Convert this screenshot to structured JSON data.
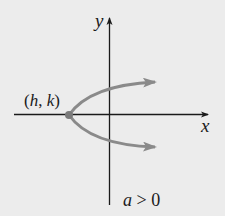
{
  "diagram": {
    "type": "parabola-graph",
    "axes": {
      "x_label": "x",
      "y_label": "y"
    },
    "vertex_label": "(h, k)",
    "vertex_parts": {
      "open": "(",
      "h": "h",
      "sep": ", ",
      "k": "k",
      "close": ")"
    },
    "condition": {
      "var": "a",
      "op": " > ",
      "value": "0",
      "full": "a > 0"
    },
    "orientation": "opens-right",
    "colors": {
      "background": "#ececec",
      "axis": "#1a1a1a",
      "curve": "#8a8a8a",
      "text": "#1a1a1a"
    }
  }
}
